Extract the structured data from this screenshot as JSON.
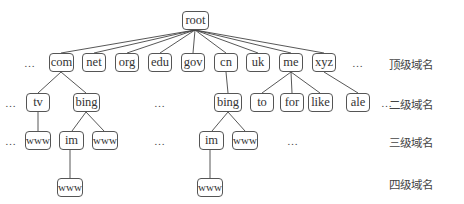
{
  "diagram": {
    "type": "tree",
    "root": {
      "label": "root"
    },
    "level_labels": [
      "顶级域名",
      "二级域名",
      "三级域名",
      "四级域名"
    ],
    "ellipsis": "…",
    "level1": [
      "com",
      "net",
      "org",
      "edu",
      "gov",
      "cn",
      "uk",
      "me",
      "xyz"
    ],
    "level2": [
      {
        "label": "tv",
        "parent": "com"
      },
      {
        "label": "bing",
        "parent": "com"
      },
      {
        "label": "bing",
        "parent": "cn"
      },
      {
        "label": "to",
        "parent": "me"
      },
      {
        "label": "for",
        "parent": "me"
      },
      {
        "label": "like",
        "parent": "me"
      },
      {
        "label": "ale",
        "parent": "xyz"
      }
    ],
    "level3": [
      {
        "label": "www",
        "parent": "tv"
      },
      {
        "label": "im",
        "parent": "bing (com)"
      },
      {
        "label": "www",
        "parent": "bing (com)"
      },
      {
        "label": "im",
        "parent": "bing (cn)"
      },
      {
        "label": "www",
        "parent": "bing (cn)"
      }
    ],
    "level4": [
      {
        "label": "www",
        "parent": "im (bing.com)"
      },
      {
        "label": "www",
        "parent": "im (bing.cn)"
      }
    ]
  }
}
